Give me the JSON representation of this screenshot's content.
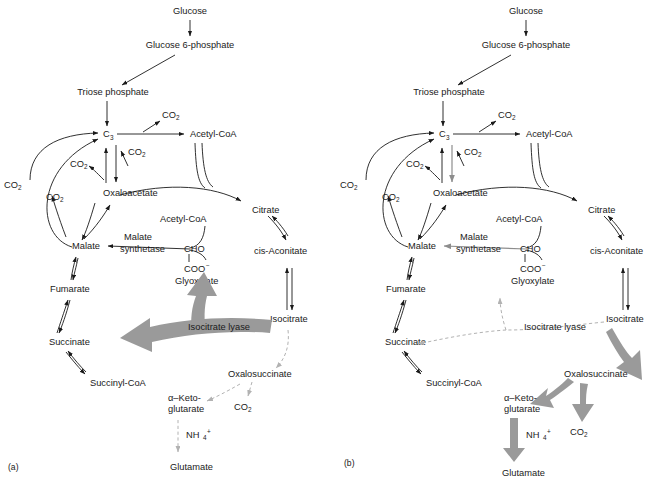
{
  "figure": {
    "panels": [
      {
        "id": "a",
        "caption": "(a)",
        "nodes": {
          "glucose": "Glucose",
          "g6p": "Glucose 6-phosphate",
          "triose": "Triose phosphate",
          "c3": "C",
          "c3_sub": "3",
          "acetyl_coa_top": "Acetyl-CoA",
          "oxaloacetate": "Oxaloacetate",
          "malate": "Malate",
          "malate_synthetase_1": "Malate",
          "malate_synthetase_2": "synthetase",
          "acetyl_coa_mid": "Acetyl-CoA",
          "cho": "CHO",
          "coo": "COO",
          "coo_sup": "−",
          "glyoxylate": "Glyoxylate",
          "citrate": "Citrate",
          "cis_aconitate": "cis-Aconitate",
          "isocitrate": "Isocitrate",
          "fumarate": "Fumarate",
          "succinate": "Succinate",
          "succinyl_coa": "Succinyl-CoA",
          "isocitrate_lyase": "Isocitrate lyase",
          "oxalosuccinate": "Oxalosuccinate",
          "akg_1": "α–Keto-",
          "akg_2": "glutarate",
          "glutamate": "Glutamate",
          "nh4": "NH",
          "nh4_sub": "4",
          "nh4_sup": "+",
          "co2": "CO",
          "co2_sub": "2"
        },
        "co2_labels": [
          {
            "id": "co2-top",
            "text": "CO",
            "sub": "2"
          },
          {
            "id": "co2-right-of-c3",
            "text": "CO",
            "sub": "2"
          },
          {
            "id": "co2-left-of-c3",
            "text": "CO",
            "sub": "2"
          },
          {
            "id": "co2-far-left",
            "text": "CO",
            "sub": "2"
          },
          {
            "id": "co2-mid-left",
            "text": "CO",
            "sub": "2"
          },
          {
            "id": "co2-bottom",
            "text": "CO",
            "sub": "2"
          }
        ],
        "highlight": "glyoxylate-shunt",
        "highlight_arrow": "Isocitrate lyase",
        "faded_path": "isocitrate-dehydrogenase-branch"
      },
      {
        "id": "b",
        "caption": "(b)",
        "nodes": {
          "glucose": "Glucose",
          "g6p": "Glucose 6-phosphate",
          "triose": "Triose phosphate",
          "c3": "C",
          "c3_sub": "3",
          "acetyl_coa_top": "Acetyl-CoA",
          "oxaloacetate": "Oxaloacetate",
          "malate": "Malate",
          "malate_synthetase_1": "Malate",
          "malate_synthetase_2": "synthetase",
          "acetyl_coa_mid": "Acetyl-CoA",
          "cho": "CHO",
          "coo": "COO",
          "coo_sup": "−",
          "glyoxylate": "Glyoxylate",
          "citrate": "Citrate",
          "cis_aconitate": "cis-Aconitate",
          "isocitrate": "Isocitrate",
          "fumarate": "Fumarate",
          "succinate": "Succinate",
          "succinyl_coa": "Succinyl-CoA",
          "isocitrate_lyase": "Isocitrate lyase",
          "oxalosuccinate": "Oxalosuccinate",
          "akg_1": "α–Keto-",
          "akg_2": "glutarate",
          "glutamate": "Glutamate",
          "nh4": "NH",
          "nh4_sub": "4",
          "nh4_sup": "+",
          "co2": "CO",
          "co2_sub": "2"
        },
        "co2_labels": [
          {
            "id": "co2-top",
            "text": "CO",
            "sub": "2"
          },
          {
            "id": "co2-right-of-c3",
            "text": "CO",
            "sub": "2"
          },
          {
            "id": "co2-left-of-c3",
            "text": "CO",
            "sub": "2"
          },
          {
            "id": "co2-far-left",
            "text": "CO",
            "sub": "2"
          },
          {
            "id": "co2-mid-left",
            "text": "CO",
            "sub": "2"
          },
          {
            "id": "co2-bottom",
            "text": "CO",
            "sub": "2"
          }
        ],
        "highlight": "isocitrate-dehydrogenase-branch",
        "highlight_arrow": "Isocitrate → Oxalosuccinate → α-Ketoglutarate → Glutamate",
        "faded_path": "isocitrate-lyase-glyoxylate-shunt"
      }
    ],
    "colors": {
      "ink": "#1a1a1a",
      "highlight_gray": "#9a9a9a",
      "faded_gray": "#b2b2b2",
      "background": "#ffffff"
    }
  }
}
